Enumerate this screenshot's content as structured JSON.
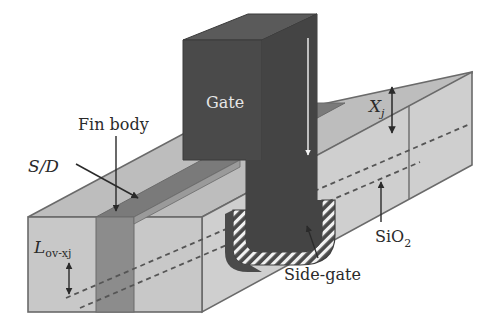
{
  "figure": {
    "labels": {
      "gate": "Gate",
      "fin_body": "Fin body",
      "source_drain": "S/D",
      "xj_main": "X",
      "xj_sub": "j",
      "lov_main": "L",
      "lov_sub": "ov-xj",
      "sio2_main": "SiO",
      "sio2_sub": "2",
      "side_gate": "Side-gate"
    },
    "colors": {
      "background": "#ffffff",
      "gate": "#4a4a4a",
      "gate_top": "#5a5a5a",
      "gate_side": "#3e3e3e",
      "oxide_front": "#c8c8c8",
      "oxide_top": "#bdbdbd",
      "oxide_side": "#cfcfcf",
      "fin": "#8c8c8c",
      "fin_top": "#7a7a7a",
      "outline": "#6a6a6a",
      "arrow": "#2a2a2a",
      "hatch": "#f2f2f2"
    }
  }
}
